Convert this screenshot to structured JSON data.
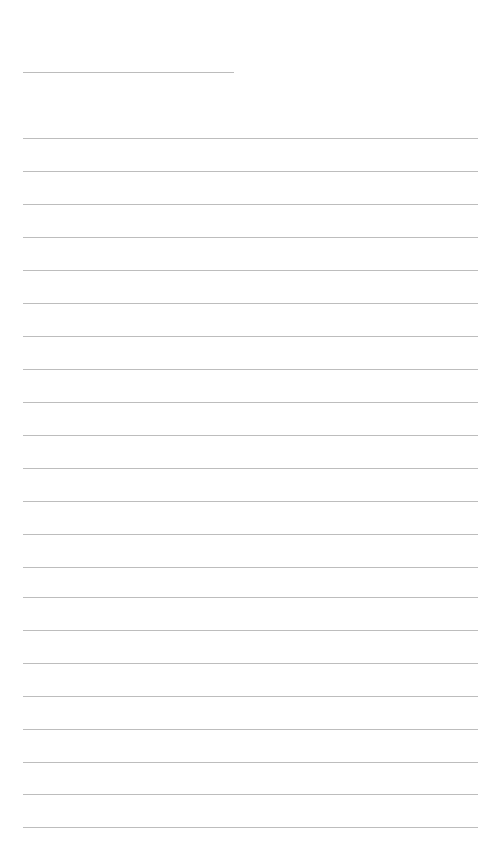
{
  "page": {
    "type": "lined-notepad",
    "background_color": "#ffffff",
    "line_color": "#bdbdbd",
    "title": {
      "text": "",
      "line_y": 72,
      "line_x": 23,
      "line_width": 211
    },
    "rules": {
      "x": 23,
      "width": 455,
      "y_positions": [
        138,
        171,
        204,
        237,
        270,
        303,
        336,
        369,
        402,
        435,
        468,
        501,
        534,
        567,
        597,
        630,
        663,
        696,
        729,
        762,
        794,
        827
      ],
      "lines": [
        "",
        "",
        "",
        "",
        "",
        "",
        "",
        "",
        "",
        "",
        "",
        "",
        "",
        "",
        "",
        "",
        "",
        "",
        "",
        "",
        "",
        ""
      ]
    }
  }
}
